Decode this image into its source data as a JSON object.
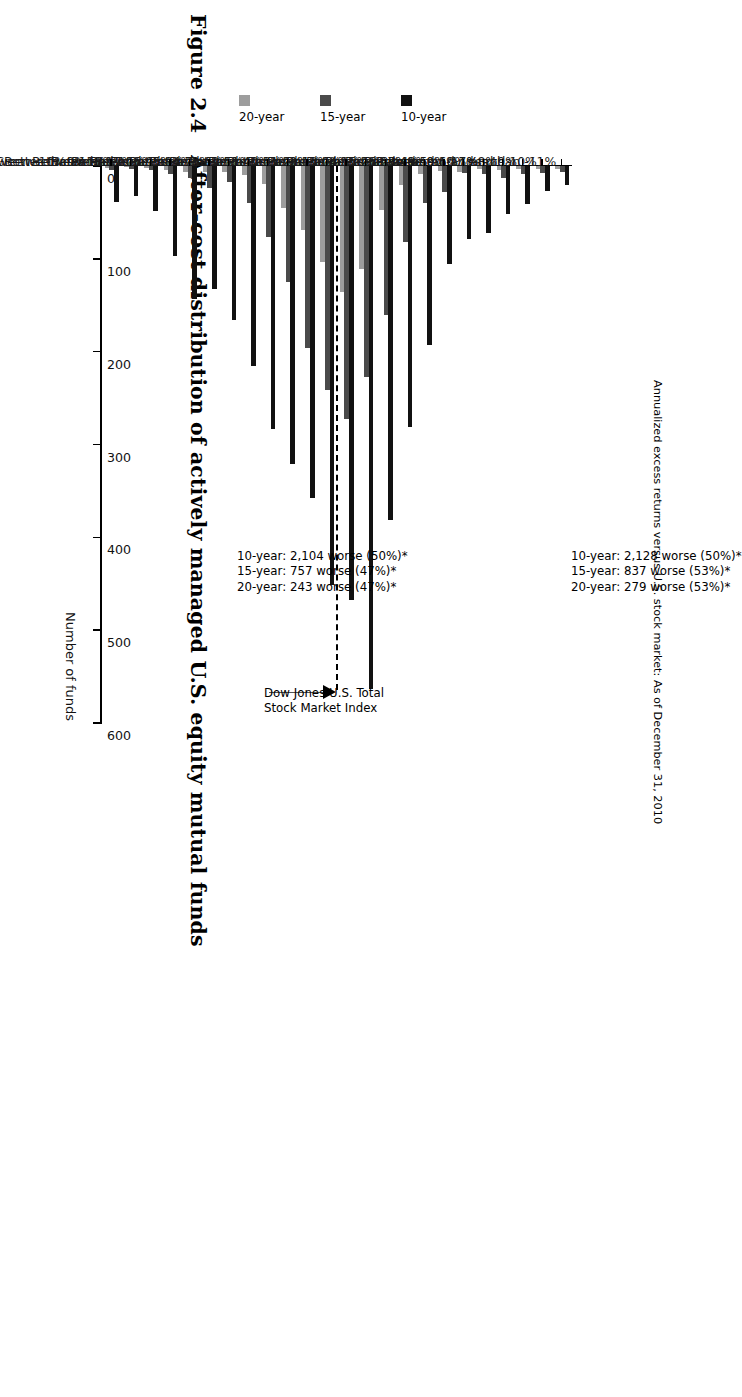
{
  "figure": {
    "number": "Figure 2.4",
    "caption": "After-cost distribution of actively managed U.S. equity mutual funds",
    "subtitle": "Annualized excess returns versus U.S. stock market: As of December 31, 2010"
  },
  "benchmark": {
    "label_line1": "Dow Jones U.S. Total",
    "label_line2": "Stock Market Index"
  },
  "legend": {
    "items": [
      {
        "label": "10-year",
        "color": "#111111"
      },
      {
        "label": "15-year",
        "color": "#4a4a4a"
      },
      {
        "label": "20-year",
        "color": "#9d9d9d"
      }
    ]
  },
  "annotations": {
    "top": {
      "line1": "10-year: 2,128 worse (50%)*",
      "line2": "15-year: 837 worse (53%)*",
      "line3": "20-year: 279 worse (53%)*"
    },
    "bottom": {
      "line1": "10-year: 2,104 worse (50%)*",
      "line2": "15-year: 757 worse (47%)*",
      "line3": "20-year: 243 worse (47%)*"
    }
  },
  "chart_data": {
    "type": "bar",
    "orientation": "horizontal",
    "title": "After-cost distribution of actively managed U.S. equity mutual funds",
    "subtitle": "Annualized excess returns versus U.S. stock market: As of December 31, 2010",
    "xlabel": "Number of funds",
    "ylabel": "",
    "xlim": [
      0,
      600
    ],
    "xticks": [
      0,
      100,
      200,
      300,
      400,
      500,
      600
    ],
    "xticklabels": [
      "0",
      "100",
      "200",
      "300",
      "400",
      "500",
      "600"
    ],
    "grid": false,
    "legend_position": "left",
    "categories": [
      "Less than -11%",
      "Between -11% and 10%",
      "Between -10% and 9%",
      "Between -9% and 8%",
      "Between -8% and 7%",
      "Between -7% and 6%",
      "Between -6% and 5%",
      "Between -5% and 4%",
      "Between -4% and 3%",
      "Between -3% and 2%",
      "Between -2% and 1%",
      "Between -1% and 0%",
      "Between -0% and 1%",
      "Between -1% and 2%",
      "Between -2% and 3%",
      "Between -3% and 4%",
      "Between -4% and 5%",
      "Between -5% and 6%",
      "Between -6% and 7%",
      "Between -7% and 8%",
      "Between -8% and 9%",
      "Between -9% and 10%",
      "Between -10% and 11%",
      "Greater than 11%"
    ],
    "series": [
      {
        "name": "10-year",
        "color": "#111111",
        "values": [
          20,
          27,
          41,
          52,
          72,
          79,
          106,
          193,
          281,
          381,
          563,
          467,
          451,
          358,
          321,
          283,
          215,
          166,
          133,
          143,
          97,
          49,
          32,
          39
        ]
      },
      {
        "name": "15-year",
        "color": "#4a4a4a",
        "values": [
          6,
          8,
          9,
          13,
          9,
          8,
          28,
          40,
          82,
          160,
          227,
          272,
          241,
          196,
          125,
          77,
          40,
          17,
          24,
          13,
          9,
          4,
          3,
          4
        ]
      },
      {
        "name": "20-year",
        "color": "#9d9d9d",
        "values": [
          3,
          3,
          3,
          4,
          3,
          6,
          5,
          9,
          20,
          47,
          111,
          136,
          103,
          69,
          45,
          19,
          10,
          6,
          7,
          7,
          4,
          2,
          1,
          2
        ]
      }
    ],
    "benchmark_marker": {
      "label": "Dow Jones U.S. Total Stock Market Index",
      "between_categories": [
        "Between -1% and 0%",
        "Between -0% and 1%"
      ]
    },
    "annotations": [
      "10-year: 2,128 worse (50%)*",
      "15-year: 837 worse (53%)*",
      "20-year: 279 worse (53%)*",
      "10-year: 2,104 worse (50%)*",
      "15-year: 757 worse (47%)*",
      "20-year: 243 worse (47%)*"
    ]
  }
}
